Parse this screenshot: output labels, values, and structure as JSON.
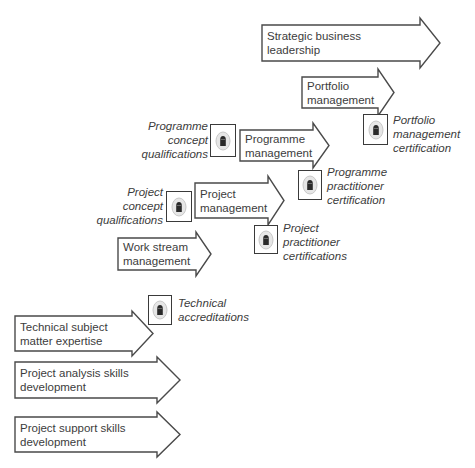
{
  "diagram": {
    "title": "",
    "arrows": [
      {
        "id": "strategic-business-leadership",
        "label": "Strategic business\nleadership",
        "x": 262,
        "y": 25,
        "w": 158,
        "h": 36,
        "head_w": 20,
        "head_over": 7
      },
      {
        "id": "portfolio-management",
        "label": "Portfolio\nmanagement",
        "x": 302,
        "y": 77,
        "w": 76,
        "h": 31,
        "head_w": 16,
        "head_over": 8
      },
      {
        "id": "programme-management",
        "label": "Programme\nmanagement",
        "x": 240,
        "y": 130,
        "w": 73,
        "h": 31,
        "head_w": 16,
        "head_over": 7
      },
      {
        "id": "project-management",
        "label": "Project\nmanagement",
        "x": 195,
        "y": 183,
        "w": 73,
        "h": 35,
        "head_w": 16,
        "head_over": 7
      },
      {
        "id": "work-stream-management",
        "label": "Work stream\nmanagement",
        "x": 118,
        "y": 238,
        "w": 78,
        "h": 32,
        "head_w": 15,
        "head_over": 6
      },
      {
        "id": "technical-subject-matter-expertise",
        "label": "Technical subject\nmatter expertise",
        "x": 15,
        "y": 316,
        "w": 117,
        "h": 35,
        "head_w": 21,
        "head_over": 5
      },
      {
        "id": "project-analysis-skills-development",
        "label": "Project analysis skills\ndevelopment",
        "x": 15,
        "y": 362,
        "w": 142,
        "h": 36,
        "head_w": 23,
        "head_over": 5
      },
      {
        "id": "project-support-skills-development",
        "label": "Project support skills\ndevelopment",
        "x": 15,
        "y": 417,
        "w": 142,
        "h": 35,
        "head_w": 23,
        "head_over": 5
      }
    ],
    "certifications": [
      {
        "id": "portfolio-management-certification",
        "label": "Portfolio\nmanagement\ncertification",
        "badge": {
          "x": 363,
          "y": 114,
          "w": 25,
          "h": 31
        },
        "text_x": 393,
        "text_y": 113,
        "align": "left"
      },
      {
        "id": "programme-concept-qualifications",
        "label": "Programme\nconcept\nqualifications",
        "badge": {
          "x": 210,
          "y": 124,
          "w": 26,
          "h": 33
        },
        "text_x": 120,
        "text_y": 119,
        "text_w": 88,
        "align": "right"
      },
      {
        "id": "programme-practitioner-certification",
        "label": "Programme\npractitioner\ncertification",
        "badge": {
          "x": 298,
          "y": 170,
          "w": 24,
          "h": 30
        },
        "text_x": 327,
        "text_y": 165,
        "align": "left"
      },
      {
        "id": "project-concept-qualifications",
        "label": "Project\nconcept\nqualifications",
        "badge": {
          "x": 166,
          "y": 191,
          "w": 26,
          "h": 31
        },
        "text_x": 75,
        "text_y": 185,
        "text_w": 88,
        "align": "right"
      },
      {
        "id": "project-practitioner-certifications",
        "label": "Project\npractitioner\ncertifications",
        "badge": {
          "x": 254,
          "y": 225,
          "w": 24,
          "h": 29
        },
        "text_x": 283,
        "text_y": 221,
        "align": "left"
      },
      {
        "id": "technical-accreditations",
        "label": "Technical\naccreditations",
        "badge": {
          "x": 148,
          "y": 295,
          "w": 24,
          "h": 30
        },
        "text_x": 178,
        "text_y": 296,
        "align": "left"
      }
    ],
    "icon": "certificate-badge-icon",
    "colors": {
      "stroke": "#4a4a4a",
      "text": "#3c3c3c",
      "badge_ring": "#c8c8c8",
      "badge_glyph": "#2a2a2a"
    }
  }
}
